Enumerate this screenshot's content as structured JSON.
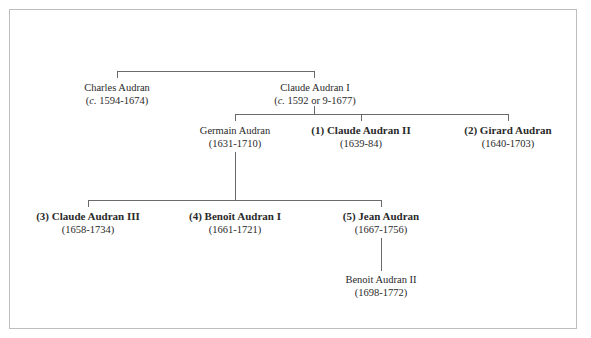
{
  "diagram": {
    "type": "family-tree",
    "nodes": [
      {
        "id": "charles",
        "name": "Charles Audran",
        "dates_prefix": "c.",
        "dates": " 1594-1674)",
        "bold": false
      },
      {
        "id": "claude1",
        "name": "Claude Audran I",
        "dates_prefix": "c.",
        "dates": " 1592 or 9-1677)",
        "bold": false
      },
      {
        "id": "germain",
        "name": "Germain Audran",
        "dates": "(1631-1710)",
        "bold": false
      },
      {
        "id": "claude2",
        "name": "(1) Claude Audran II",
        "dates": "(1639-84)",
        "bold": true
      },
      {
        "id": "girard",
        "name": "(2) Girard Audran",
        "dates": "(1640-1703)",
        "bold": true
      },
      {
        "id": "claude3",
        "name": "(3) Claude Audran III",
        "dates": "(1658-1734)",
        "bold": true
      },
      {
        "id": "benoit1",
        "name": "(4) Benoît Audran I",
        "dates": "(1661-1721)",
        "bold": true
      },
      {
        "id": "jean",
        "name": "(5) Jean Audran",
        "dates": "(1667-1756)",
        "bold": true
      },
      {
        "id": "benoit2",
        "name": "Benoit Audran II",
        "dates": "(1698-1772)",
        "bold": false
      }
    ],
    "edges": [
      {
        "from": "parent-unknown",
        "to": [
          "charles",
          "claude1"
        ]
      },
      {
        "from": "claude1",
        "to": [
          "germain",
          "claude2",
          "girard"
        ]
      },
      {
        "from": "germain",
        "to": [
          "claude3",
          "benoit1",
          "jean"
        ]
      },
      {
        "from": "jean",
        "to": [
          "benoit2"
        ]
      }
    ],
    "open_paren": "("
  }
}
